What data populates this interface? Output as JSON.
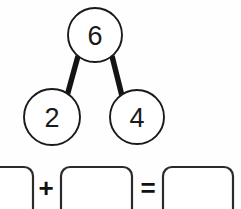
{
  "canvas": {
    "width": 241,
    "height": 209,
    "background_color": "#fefefe",
    "ink_color": "#1a1a1a"
  },
  "number_bond": {
    "whole": {
      "label": "6",
      "cx": 95,
      "cy": 35,
      "r": 27
    },
    "parts": [
      {
        "label": "2",
        "cx": 52,
        "cy": 117,
        "r": 28
      },
      {
        "label": "4",
        "cx": 137,
        "cy": 117,
        "r": 27
      }
    ],
    "connectors": [
      {
        "x1": 78,
        "y1": 56,
        "x2": 67,
        "y2": 96
      },
      {
        "x1": 112,
        "y1": 56,
        "x2": 122,
        "y2": 96
      }
    ]
  },
  "equation": {
    "boxes": [
      {
        "name": "addend-1",
        "value": "",
        "x": -14,
        "y": 167,
        "width": 47,
        "height": 52,
        "rx": 9
      },
      {
        "name": "addend-2",
        "value": "",
        "x": 61,
        "y": 167,
        "width": 71,
        "height": 52,
        "rx": 9
      },
      {
        "name": "sum",
        "value": "",
        "x": 163,
        "y": 167,
        "width": 70,
        "height": 52,
        "rx": 9
      }
    ],
    "operators": [
      {
        "name": "plus",
        "symbol": "+",
        "cx": 46,
        "cy": 188
      },
      {
        "name": "equals",
        "symbol": "=",
        "cx": 148,
        "cy": 188
      }
    ]
  }
}
